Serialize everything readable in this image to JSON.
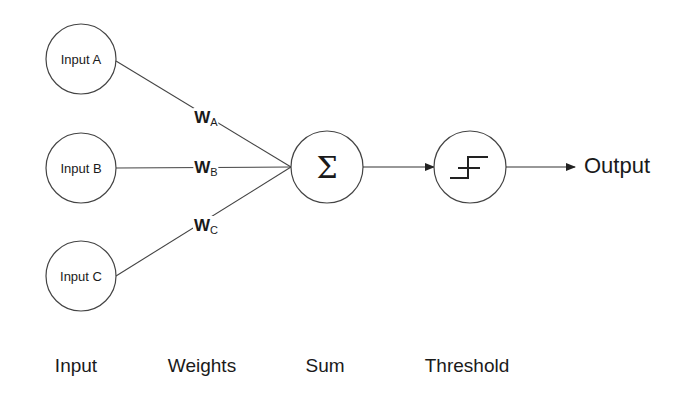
{
  "inputs": [
    {
      "label": "Input A"
    },
    {
      "label": "Input B"
    },
    {
      "label": "Input C"
    }
  ],
  "weights": [
    {
      "symbol": "W",
      "subscript": "A"
    },
    {
      "symbol": "W",
      "subscript": "B"
    },
    {
      "symbol": "W",
      "subscript": "C"
    }
  ],
  "sum_node": {
    "symbol": "Σ",
    "icon": "sigma-icon"
  },
  "threshold_node": {
    "icon": "step-function-icon"
  },
  "output": {
    "label": "Output"
  },
  "captions": {
    "input": "Input",
    "weights": "Weights",
    "sum": "Sum",
    "threshold": "Threshold"
  }
}
